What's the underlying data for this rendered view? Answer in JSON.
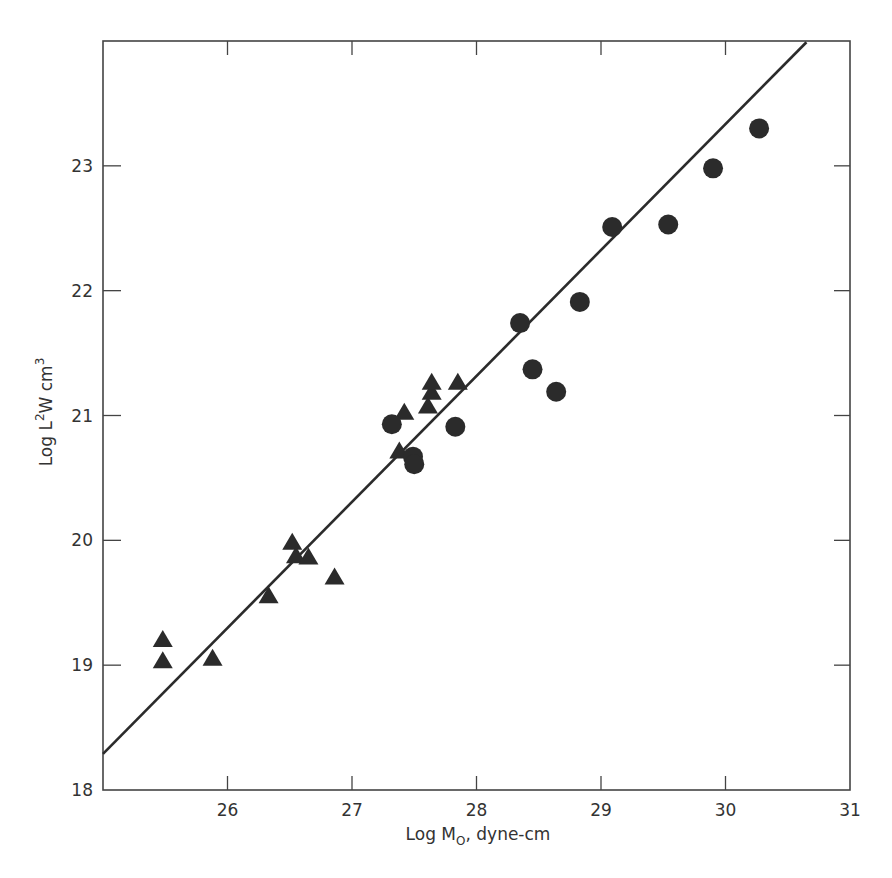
{
  "chart_data": {
    "type": "scatter",
    "title": "",
    "xlabel": "Log M0, dyne-cm",
    "xlabel_parts": {
      "pre": "Log M",
      "sub": "O",
      "post": ", dyne-cm"
    },
    "ylabel": "Log L²W cm³",
    "ylabel_parts": {
      "pre": "Log L",
      "sup1": "2",
      "mid": "W  cm",
      "sup2": "3"
    },
    "xlim": [
      25,
      31
    ],
    "ylim": [
      18,
      24
    ],
    "xticks": [
      26,
      27,
      28,
      29,
      30,
      31
    ],
    "yticks": [
      18,
      19,
      20,
      21,
      22,
      23
    ],
    "grid": false,
    "legend": null,
    "series": [
      {
        "name": "triangles",
        "marker": "triangle",
        "color": "#2b2b2b",
        "points": [
          [
            25.48,
            19.2
          ],
          [
            25.48,
            19.03
          ],
          [
            25.88,
            19.05
          ],
          [
            26.33,
            19.55
          ],
          [
            26.52,
            19.98
          ],
          [
            26.55,
            19.87
          ],
          [
            26.65,
            19.86
          ],
          [
            26.86,
            19.7
          ],
          [
            27.38,
            20.71
          ],
          [
            27.42,
            21.02
          ],
          [
            27.61,
            21.07
          ],
          [
            27.64,
            21.18
          ],
          [
            27.64,
            21.26
          ],
          [
            27.85,
            21.26
          ]
        ]
      },
      {
        "name": "circles",
        "marker": "circle",
        "color": "#2b2b2b",
        "points": [
          [
            27.32,
            20.93
          ],
          [
            27.49,
            20.67
          ],
          [
            27.5,
            20.61
          ],
          [
            27.83,
            20.91
          ],
          [
            28.35,
            21.74
          ],
          [
            28.45,
            21.37
          ],
          [
            28.64,
            21.19
          ],
          [
            28.83,
            21.91
          ],
          [
            29.09,
            22.51
          ],
          [
            29.54,
            22.53
          ],
          [
            29.9,
            22.98
          ],
          [
            30.27,
            23.3
          ]
        ]
      }
    ],
    "fit_line": {
      "name": "regression",
      "color": "#2b2b2b",
      "from": [
        25.0,
        18.29
      ],
      "to": [
        30.65,
        23.99
      ]
    }
  }
}
